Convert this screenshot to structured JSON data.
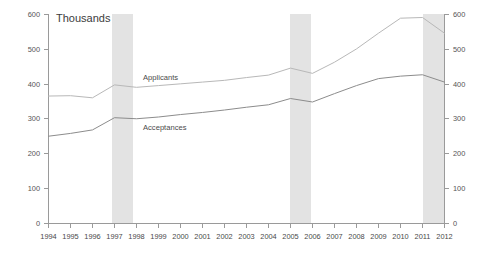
{
  "chart_data": {
    "type": "line",
    "title": "Thousands",
    "xlabel": "",
    "ylabel": "",
    "ylim": [
      0,
      600
    ],
    "ytick_step": 100,
    "yticks": [
      0,
      100,
      200,
      300,
      400,
      500,
      600
    ],
    "ytick_labels": [
      "0",
      "100",
      "200",
      "300",
      "400",
      "500",
      "600"
    ],
    "dual_y_axis": true,
    "right_yticks": [
      0,
      100,
      200,
      300,
      400,
      500,
      600
    ],
    "right_ytick_labels": [
      "0",
      "100",
      "200",
      "300",
      "400",
      "500",
      "600"
    ],
    "grid": false,
    "legend_position": "inline-annotation",
    "x": [
      1994,
      1995,
      1996,
      1997,
      1998,
      1999,
      2000,
      2001,
      2002,
      2003,
      2004,
      2005,
      2006,
      2007,
      2008,
      2009,
      2010,
      2011,
      2012
    ],
    "xtick_labels": [
      "1994",
      "1995",
      "1996",
      "1997",
      "1998",
      "1999",
      "2000",
      "2001",
      "2002",
      "2003",
      "2004",
      "2005",
      "2006",
      "2007",
      "2008",
      "2009",
      "2010",
      "2011",
      "2012"
    ],
    "series": [
      {
        "name": "Applicants",
        "color": "#b8b8b8",
        "values": [
          365,
          366,
          360,
          397,
          390,
          395,
          400,
          405,
          410,
          418,
          425,
          445,
          430,
          462,
          500,
          545,
          588,
          590,
          545
        ]
      },
      {
        "name": "Acceptances",
        "color": "#8c8c8c",
        "values": [
          250,
          258,
          268,
          303,
          300,
          305,
          312,
          318,
          325,
          333,
          340,
          358,
          348,
          372,
          395,
          415,
          422,
          426,
          405
        ]
      }
    ],
    "shaded_regions": [
      {
        "label": "recession-band-1997-1998",
        "start": 1997,
        "end": 1998,
        "color": "#e3e3e3"
      },
      {
        "label": "recession-band-2005-2006",
        "start": 2005,
        "end": 2006,
        "color": "#e3e3e3"
      },
      {
        "label": "recession-band-2011-2012",
        "start": 2011,
        "end": 2012,
        "color": "#e3e3e3"
      }
    ],
    "annotations": [
      {
        "name": "applicants-label",
        "text": "Applicants",
        "x": 2000,
        "y": 425
      },
      {
        "name": "acceptances-label",
        "text": "Acceptances",
        "x": 2000,
        "y": 278
      }
    ]
  }
}
